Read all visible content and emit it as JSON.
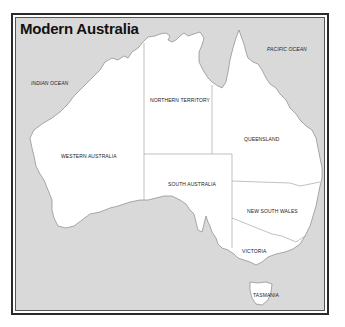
{
  "map": {
    "title": "Modern Australia",
    "colors": {
      "ocean": "#d9d9d9",
      "land": "#ffffff",
      "border": "#888888",
      "frame": "#2a2a2a"
    },
    "oceans": [
      {
        "name": "INDIAN OCEAN"
      },
      {
        "name": "PACIFIC OCEAN"
      }
    ],
    "regions": [
      {
        "name": "WESTERN AUSTRALIA"
      },
      {
        "name": "NORTHERN TERRITORY"
      },
      {
        "name": "QUEENSLAND"
      },
      {
        "name": "SOUTH AUSTRALIA"
      },
      {
        "name": "NEW SOUTH WALES"
      },
      {
        "name": "VICTORIA"
      },
      {
        "name": "TASMANIA"
      }
    ]
  }
}
